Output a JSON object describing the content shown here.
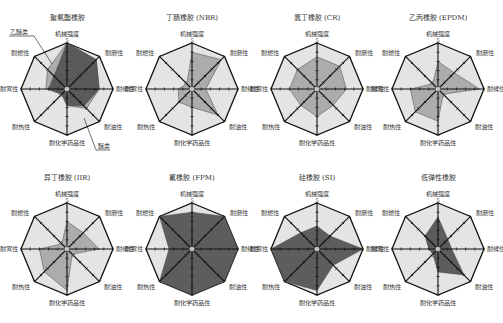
{
  "chart_data": [
    {
      "type": "radar",
      "title": "聚氨酯橡胶",
      "axes": [
        "机械强度",
        "耐磨性",
        "耐候性",
        "耐油性",
        "耐化学药品性",
        "耐热性",
        "耐寒性",
        "耐燃性"
      ],
      "scale": [
        0,
        5
      ],
      "series": [
        {
          "name": "乙醚类",
          "values": [
            5,
            4.5,
            3.5,
            3,
            1.8,
            0.8,
            2.3,
            3
          ]
        },
        {
          "name": "醚类",
          "values": [
            5,
            4.5,
            3.5,
            2.6,
            1.8,
            0.8,
            2,
            2
          ]
        }
      ],
      "annotations": [
        "乙醚类",
        "醚类"
      ]
    },
    {
      "type": "radar",
      "title": "丁腈橡胶 (NBR)",
      "axes": [
        "机械强度",
        "耐磨性",
        "耐候性",
        "耐油性",
        "耐化学药品性",
        "耐热性",
        "耐寒性",
        "耐燃性"
      ],
      "scale": [
        0,
        5
      ],
      "series": [
        {
          "name": "NBR",
          "values": [
            4,
            4.5,
            1.5,
            4,
            2,
            2,
            1.5,
            0.8
          ]
        }
      ]
    },
    {
      "type": "radar",
      "title": "氯丁橡胶 (CR)",
      "axes": [
        "机械强度",
        "耐磨性",
        "耐候性",
        "耐油性",
        "耐化学药品性",
        "耐热性",
        "耐寒性",
        "耐燃性"
      ],
      "scale": [
        0,
        5
      ],
      "series": [
        {
          "name": "CR",
          "values": [
            3.5,
            3.5,
            3.2,
            2.5,
            3,
            2.5,
            3,
            3
          ]
        }
      ]
    },
    {
      "type": "radar",
      "title": "乙丙橡胶 (EPDM)",
      "axes": [
        "机械强度",
        "耐磨性",
        "耐候性",
        "耐油性",
        "耐化学药品性",
        "耐热性",
        "耐寒性",
        "耐燃性"
      ],
      "scale": [
        0,
        5
      ],
      "series": [
        {
          "name": "EPDM",
          "values": [
            3,
            2.5,
            4.5,
            0.8,
            3.5,
            3.5,
            3,
            0.8
          ]
        }
      ]
    },
    {
      "type": "radar",
      "title": "异丁橡胶 (IIR)",
      "axes": [
        "机械强度",
        "耐磨性",
        "耐候性",
        "耐油性",
        "耐化学药品性",
        "耐热性",
        "耐寒性",
        "耐燃性"
      ],
      "scale": [
        0,
        5
      ],
      "series": [
        {
          "name": "IIR",
          "values": [
            3,
            2.5,
            3.5,
            0.8,
            4.5,
            3.5,
            3,
            0.8
          ]
        }
      ]
    },
    {
      "type": "radar",
      "title": "氟橡胶 (FPM)",
      "axes": [
        "机械强度",
        "耐磨性",
        "耐候性",
        "耐油性",
        "耐化学药品性",
        "耐热性",
        "耐寒性",
        "耐燃性"
      ],
      "scale": [
        0,
        5
      ],
      "series": [
        {
          "name": "FPM",
          "values": [
            4,
            5,
            5,
            5,
            5,
            5,
            2.5,
            5
          ]
        }
      ]
    },
    {
      "type": "radar",
      "title": "硅橡胶 (SI)",
      "axes": [
        "机械强度",
        "耐磨性",
        "耐候性",
        "耐油性",
        "耐化学药品性",
        "耐热性",
        "耐寒性",
        "耐燃性"
      ],
      "scale": [
        0,
        5
      ],
      "series": [
        {
          "name": "SI",
          "values": [
            2.5,
            2,
            5,
            2.5,
            4.5,
            5,
            5,
            2.5
          ]
        }
      ]
    },
    {
      "type": "radar",
      "title": "低弹性橡胶",
      "axes": [
        "机械强度",
        "耐磨性",
        "耐候性",
        "耐油性",
        "耐化学药品性",
        "耐热性",
        "耐寒性",
        "耐燃性"
      ],
      "scale": [
        0,
        5
      ],
      "series": [
        {
          "name": "低弹性橡胶",
          "values": [
            3.5,
            1.5,
            1.5,
            4,
            2.5,
            0.8,
            1,
            2
          ]
        }
      ]
    }
  ],
  "ui": {
    "center_label": "0",
    "max_label": "5",
    "colors": {
      "outer_fill": "#e4e4e4",
      "series_fill_light": "#a9a9a9",
      "series_fill_dark": "#555555",
      "axis": "#111111"
    }
  }
}
